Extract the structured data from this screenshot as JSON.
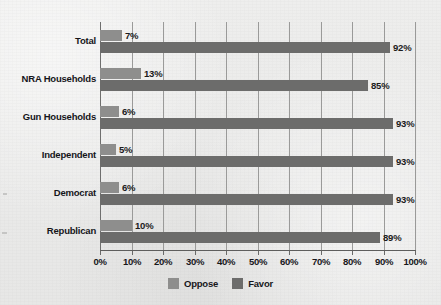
{
  "chart_data": {
    "type": "bar",
    "orientation": "horizontal",
    "title": "",
    "subtitle": "",
    "xlabel": "",
    "ylabel": "",
    "xlim": [
      0,
      100
    ],
    "xticks": [
      "0%",
      "10%",
      "20%",
      "30%",
      "40%",
      "50%",
      "60%",
      "70%",
      "80%",
      "90%",
      "100%"
    ],
    "xtick_values": [
      0,
      10,
      20,
      30,
      40,
      50,
      60,
      70,
      80,
      90,
      100
    ],
    "grid": true,
    "grid_axis": "x",
    "legend_position": "bottom-center",
    "categories": [
      "Total",
      "NRA Households",
      "Gun Households",
      "Independent",
      "Democrat",
      "Republican"
    ],
    "series": [
      {
        "name": "Oppose",
        "color": "#8e8e8d",
        "values": [
          7,
          13,
          6,
          5,
          6,
          10
        ],
        "labels": [
          "7%",
          "13%",
          "6%",
          "5%",
          "6%",
          "10%"
        ]
      },
      {
        "name": "Favor",
        "color": "#6c6c6b",
        "values": [
          92,
          85,
          93,
          93,
          93,
          89
        ],
        "labels": [
          "92%",
          "85%",
          "93%",
          "93%",
          "93%",
          "89%"
        ]
      }
    ]
  },
  "legend": {
    "items": [
      {
        "label": "Oppose",
        "swatch": "legend-swatch-oppose"
      },
      {
        "label": "Favor",
        "swatch": "legend-swatch-favor"
      }
    ]
  },
  "colors": {
    "background": "#ececeb",
    "oppose": "#8e8e8d",
    "favor": "#6c6c6b",
    "gridline": "#9a9a99",
    "axis": "#5e5e5d",
    "text": "#17171b"
  }
}
